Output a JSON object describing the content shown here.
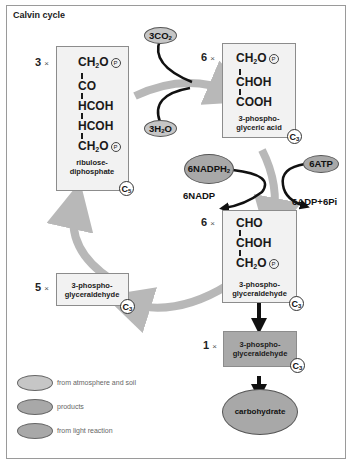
{
  "title": "Calvin cycle",
  "colors": {
    "box_fill": "#f2f2f2",
    "box_dark_fill": "#a9a9a9",
    "cycle_arrow": "#b8b8b8",
    "reaction_arrow": "#111111",
    "ellipse_input": "#c6c6c6",
    "ellipse_product": "#a8a8a8",
    "ellipse_light": "#a8a8a8"
  },
  "nodes": {
    "rubp": {
      "multiplier": "3",
      "formula_lines": [
        "CH2O(P)",
        "CO",
        "HCOH",
        "HCOH",
        "CH2O(P)"
      ],
      "name_line1": "ribulose-",
      "name_line2": "diphosphate",
      "carbon": "C",
      "carbon_sub": "5"
    },
    "pga": {
      "multiplier": "6",
      "formula_lines": [
        "CH2O(P)",
        "CHOH",
        "COOH"
      ],
      "name_line1": "3-phospho-",
      "name_line2": "glyceric acid",
      "carbon": "C",
      "carbon_sub": "3"
    },
    "g3p_main": {
      "multiplier": "6",
      "formula_lines": [
        "CHO",
        "CHOH",
        "CH2O(P)"
      ],
      "name_line1": "3-phospho-",
      "name_line2": "glyceraldehyde",
      "carbon": "C",
      "carbon_sub": "3"
    },
    "g3p_recycle": {
      "multiplier": "5",
      "name_line1": "3-phospho-",
      "name_line2": "glyceraldehyde",
      "carbon": "C",
      "carbon_sub": "3"
    },
    "g3p_output": {
      "multiplier": "1",
      "name_line1": "3-phospho-",
      "name_line2": "glyceraldehyde",
      "carbon": "C",
      "carbon_sub": "3"
    },
    "carbohydrate": {
      "label": "carbohydrate"
    }
  },
  "inputs": {
    "co2": {
      "label": "3CO",
      "sub": "2"
    },
    "h2o": {
      "label": "3H",
      "sub": "2",
      "suffix": "O"
    },
    "nadph": {
      "label": "6NADPH",
      "sub": "2"
    },
    "atp": {
      "label": "6ATP"
    }
  },
  "outputs": {
    "nadp": "6NADP",
    "adp": "6ADP+6Pi"
  },
  "multiplier_sign": "×",
  "phosphate_symbol": "P",
  "legend": [
    {
      "label": "from atmosphere and soil",
      "color": "#c6c6c6"
    },
    {
      "label": "products",
      "color": "#a8a8a8"
    },
    {
      "label": "from light reaction",
      "color": "#a8a8a8"
    }
  ]
}
